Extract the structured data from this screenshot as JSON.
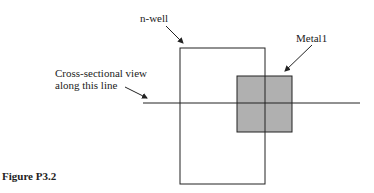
{
  "figure": {
    "caption": "Figure P3.2",
    "labels": {
      "nwell": "n-well",
      "metal1": "Metal1",
      "cross_line1": "Cross-sectional view",
      "cross_line2": "along this line"
    },
    "colors": {
      "stroke": "#222222",
      "metal_fill": "#b0b0b0",
      "background": "#ffffff"
    },
    "shapes": {
      "nwell_rect": {
        "x": 180,
        "y": 48,
        "w": 85,
        "h": 136
      },
      "metal1_rect": {
        "x": 237,
        "y": 76,
        "w": 55,
        "h": 56
      },
      "cut_line": {
        "x1": 143,
        "y1": 103,
        "x2": 360,
        "y2": 103
      }
    }
  }
}
